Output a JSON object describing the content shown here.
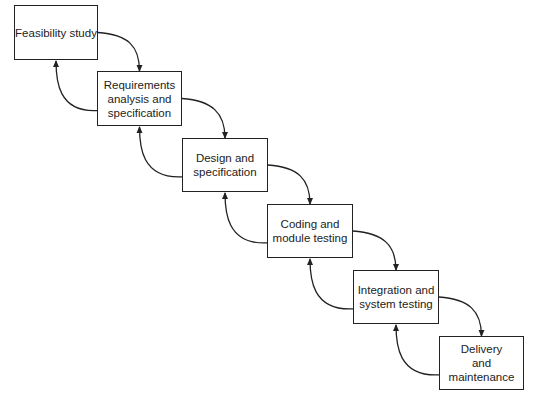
{
  "diagram": {
    "type": "waterfall-model",
    "colors": {
      "stroke": "#222222",
      "background": "#ffffff"
    },
    "phases": [
      {
        "id": "feasibility",
        "label": "Feasibility study",
        "x": 14,
        "y": 5,
        "w": 84,
        "h": 55
      },
      {
        "id": "requirements",
        "label": "Requirements\nanalysis and\nspecification",
        "x": 97,
        "y": 71,
        "w": 85,
        "h": 55
      },
      {
        "id": "design",
        "label": "Design and\nspecification",
        "x": 182,
        "y": 138,
        "w": 86,
        "h": 54
      },
      {
        "id": "coding",
        "label": "Coding and\nmodule testing",
        "x": 267,
        "y": 204,
        "w": 86,
        "h": 54
      },
      {
        "id": "integration",
        "label": "Integration and\nsystem testing",
        "x": 353,
        "y": 270,
        "w": 86,
        "h": 54
      },
      {
        "id": "delivery",
        "label": "Delivery\nand\nmaintenance",
        "x": 439,
        "y": 336,
        "w": 85,
        "h": 54
      }
    ],
    "forward_arrows": [
      {
        "from": "feasibility",
        "to": "requirements"
      },
      {
        "from": "requirements",
        "to": "design"
      },
      {
        "from": "design",
        "to": "coding"
      },
      {
        "from": "coding",
        "to": "integration"
      },
      {
        "from": "integration",
        "to": "delivery"
      }
    ],
    "feedback_arrows": [
      {
        "from": "requirements",
        "to": "feasibility"
      },
      {
        "from": "design",
        "to": "requirements"
      },
      {
        "from": "coding",
        "to": "design"
      },
      {
        "from": "integration",
        "to": "coding"
      },
      {
        "from": "delivery",
        "to": "integration"
      }
    ]
  }
}
